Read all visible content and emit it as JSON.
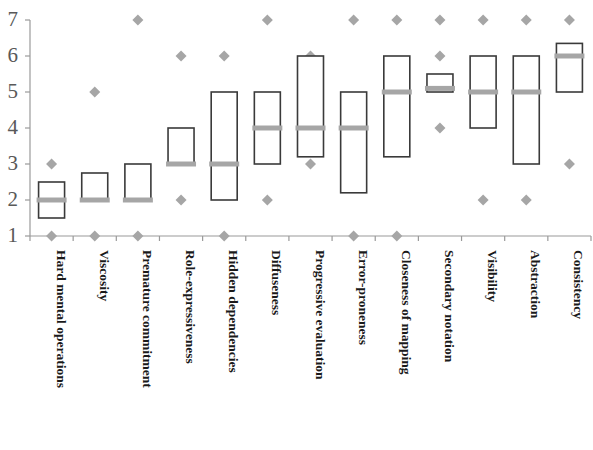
{
  "chart_data": {
    "type": "bar",
    "subtype": "box-plot",
    "title": "",
    "subtitle": "",
    "xlabel": "",
    "ylabel": "",
    "ylim": [
      1,
      7
    ],
    "yticks": [
      1,
      2,
      3,
      4,
      5,
      6,
      7
    ],
    "ytick_labels": [
      "1",
      "2",
      "3",
      "4",
      "5",
      "6",
      "7"
    ],
    "grid": false,
    "legend": null,
    "legend_position": "none",
    "colors": {
      "box_stroke": "#3a3a3a",
      "box_fill": "#ffffff",
      "median": "#a6a6a6",
      "outlier": "#a6a6a6",
      "axis": "#9a9a9a",
      "ytick_text": "#595959",
      "category_text": "#1a1a1a"
    },
    "categories": [
      "Hard mental operations",
      "Viscosity",
      "Premature commitment",
      "Role-expressiveness",
      "Hidden dependencies",
      "Diffuseness",
      "Progressive evaluation",
      "Error-proneness",
      "Closeness of mapping",
      "Secondary notation",
      "Visibility",
      "Abstraction",
      "Consistency"
    ],
    "series": [
      {
        "name": "Hard mental operations",
        "q1": 1.5,
        "median": 2,
        "q3": 2.5,
        "outliers": [
          1,
          3
        ]
      },
      {
        "name": "Viscosity",
        "q1": 2,
        "median": 2,
        "q3": 2.75,
        "outliers": [
          1,
          5
        ]
      },
      {
        "name": "Premature commitment",
        "q1": 2,
        "median": 2,
        "q3": 3,
        "outliers": [
          1,
          7
        ]
      },
      {
        "name": "Role-expressiveness",
        "q1": 3,
        "median": 3,
        "q3": 4,
        "outliers": [
          2,
          6
        ]
      },
      {
        "name": "Hidden dependencies",
        "q1": 2,
        "median": 3,
        "q3": 5,
        "outliers": [
          1,
          6
        ]
      },
      {
        "name": "Diffuseness",
        "q1": 3,
        "median": 4,
        "q3": 5,
        "outliers": [
          2,
          7
        ]
      },
      {
        "name": "Progressive evaluation",
        "q1": 3.2,
        "median": 4,
        "q3": 6,
        "outliers": [
          3,
          6
        ]
      },
      {
        "name": "Error-proneness",
        "q1": 2.2,
        "median": 4,
        "q3": 5,
        "outliers": [
          1,
          7
        ]
      },
      {
        "name": "Closeness of mapping",
        "q1": 3.2,
        "median": 5,
        "q3": 6,
        "outliers": [
          1,
          7
        ]
      },
      {
        "name": "Secondary notation",
        "q1": 5,
        "median": 5.1,
        "q3": 5.5,
        "outliers": [
          4,
          6,
          7
        ]
      },
      {
        "name": "Visibility",
        "q1": 4,
        "median": 5,
        "q3": 6,
        "outliers": [
          2,
          7
        ]
      },
      {
        "name": "Abstraction",
        "q1": 3,
        "median": 5,
        "q3": 6,
        "outliers": [
          2,
          7
        ]
      },
      {
        "name": "Consistency",
        "q1": 5,
        "median": 6,
        "q3": 6.35,
        "outliers": [
          3,
          7
        ]
      }
    ]
  }
}
